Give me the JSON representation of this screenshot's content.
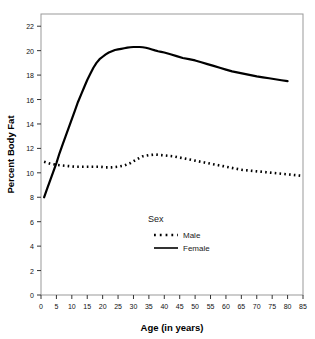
{
  "chart_data": {
    "type": "line",
    "title": "",
    "xlabel": "Age (in years)",
    "ylabel": "Percent Body Fat",
    "xlim": [
      0,
      85
    ],
    "ylim": [
      0,
      23
    ],
    "xticks": [
      0,
      5,
      10,
      15,
      20,
      25,
      30,
      35,
      40,
      45,
      50,
      55,
      60,
      65,
      70,
      75,
      80,
      85
    ],
    "yticks": [
      0,
      2,
      4,
      6,
      8,
      10,
      12,
      14,
      16,
      18,
      20,
      22
    ],
    "grid": false,
    "legend": {
      "title": "Sex",
      "position": "inside-bottom-center",
      "entries": [
        {
          "label": "Male",
          "style": "dotted"
        },
        {
          "label": "Female",
          "style": "solid"
        }
      ]
    },
    "series": [
      {
        "name": "Female",
        "style": "solid",
        "color": "#000000",
        "x": [
          1,
          2,
          3,
          4,
          5,
          6,
          7,
          8,
          9,
          10,
          11,
          12,
          13,
          14,
          15,
          16,
          17,
          18,
          19,
          20,
          21,
          22,
          23,
          24,
          25,
          26,
          27,
          28,
          29,
          30,
          31,
          32,
          33,
          34,
          35,
          36,
          37,
          38,
          39,
          40,
          42,
          44,
          46,
          48,
          50,
          52,
          54,
          56,
          58,
          60,
          62,
          64,
          66,
          68,
          70,
          72,
          74,
          76,
          78,
          80
        ],
        "y": [
          8.0,
          8.7,
          9.4,
          10.1,
          10.8,
          11.6,
          12.3,
          13.0,
          13.7,
          14.4,
          15.1,
          15.8,
          16.4,
          17.0,
          17.6,
          18.1,
          18.6,
          19.0,
          19.3,
          19.5,
          19.7,
          19.85,
          19.95,
          20.05,
          20.1,
          20.15,
          20.2,
          20.25,
          20.28,
          20.3,
          20.3,
          20.3,
          20.28,
          20.24,
          20.18,
          20.1,
          20.02,
          19.95,
          19.9,
          19.85,
          19.7,
          19.55,
          19.4,
          19.3,
          19.2,
          19.05,
          18.9,
          18.75,
          18.6,
          18.45,
          18.3,
          18.2,
          18.1,
          18.0,
          17.9,
          17.82,
          17.74,
          17.66,
          17.58,
          17.5
        ]
      },
      {
        "name": "Male",
        "style": "dotted",
        "color": "#000000",
        "x": [
          1,
          3,
          5,
          7,
          9,
          11,
          13,
          15,
          17,
          19,
          21,
          23,
          25,
          27,
          29,
          31,
          33,
          35,
          37,
          39,
          41,
          43,
          45,
          47,
          49,
          51,
          53,
          55,
          57,
          59,
          61,
          63,
          65,
          67,
          69,
          71,
          73,
          75,
          77,
          79,
          81,
          83,
          85
        ],
        "y": [
          10.9,
          10.75,
          10.65,
          10.6,
          10.55,
          10.5,
          10.5,
          10.5,
          10.5,
          10.5,
          10.45,
          10.45,
          10.5,
          10.6,
          10.8,
          11.1,
          11.35,
          11.45,
          11.5,
          11.45,
          11.4,
          11.35,
          11.25,
          11.15,
          11.05,
          10.95,
          10.85,
          10.75,
          10.65,
          10.55,
          10.45,
          10.35,
          10.25,
          10.2,
          10.15,
          10.1,
          10.05,
          10.0,
          9.95,
          9.9,
          9.85,
          9.8,
          9.75
        ]
      }
    ]
  },
  "axes": {
    "x_label": "Age (in years)",
    "y_label": "Percent Body Fat"
  },
  "legend": {
    "title": "Sex",
    "male_label": "Male",
    "female_label": "Female"
  },
  "colors": {
    "line": "#000000",
    "frame": "#999999",
    "text": "#111111"
  }
}
